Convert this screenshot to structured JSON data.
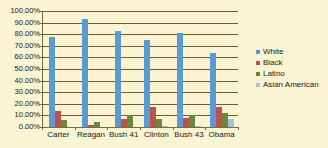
{
  "chart_data": {
    "type": "bar",
    "title": "",
    "xlabel": "",
    "ylabel": "",
    "ylim": [
      0,
      1.0
    ],
    "grid": true,
    "legend_position": "right",
    "categories": [
      "Carter",
      "Reagan",
      "Bush 41",
      "Clinton",
      "Bush 43",
      "Obama"
    ],
    "ytick_labels": [
      "100.00%",
      "90.00%",
      "80.00%",
      "70.00%",
      "60.00%",
      "50.00%",
      "40.00%",
      "30.00%",
      "20.00%",
      "10.00%",
      "0.00%"
    ],
    "ytick_values": [
      100,
      90,
      80,
      70,
      60,
      50,
      40,
      30,
      20,
      10,
      0
    ],
    "series": [
      {
        "name": "White",
        "color": "#5b9bd5",
        "values": [
          78,
          93,
          83,
          75,
          81,
          64
        ]
      },
      {
        "name": "Black",
        "color": "#c0504d",
        "values": [
          14,
          2,
          7,
          17,
          8,
          17
        ]
      },
      {
        "name": "Latino",
        "color": "#6a8a3a",
        "values": [
          6,
          4,
          10,
          7,
          10,
          12
        ]
      },
      {
        "name": "Asian American",
        "color": "#9ec3dd",
        "values": [
          0,
          0,
          0,
          1,
          1,
          7
        ]
      }
    ]
  },
  "legend": {
    "items": [
      {
        "label": "White",
        "color": "#5b9bd5"
      },
      {
        "label": "Black",
        "color": "#c0504d"
      },
      {
        "label": "Latino",
        "color": "#6a8a3a"
      },
      {
        "label": "Asian American",
        "color": "#9ec3dd"
      }
    ]
  },
  "colors": {
    "background": "#faf4d2",
    "gridline": "#6b5d35",
    "axis": "#7a6a3c",
    "text": "#1b1b17"
  }
}
